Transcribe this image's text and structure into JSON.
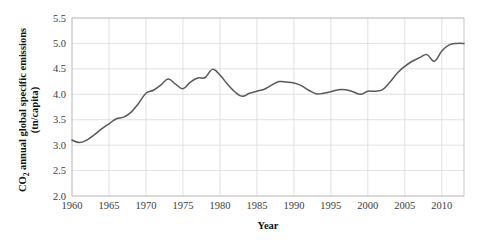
{
  "chart_data": {
    "type": "line",
    "title": "",
    "xlabel": "Year",
    "ylabel_main": "CO",
    "ylabel_sub": "2",
    "ylabel_rest": " annual global specific emissions",
    "ylabel_line2": "(tn/capita)",
    "ylabel_full": "CO2 annual global specific emissions (tn/capita)",
    "xlim": [
      1960,
      2013
    ],
    "ylim": [
      2.0,
      5.5
    ],
    "grid": true,
    "legend": "none",
    "y_ticks": [
      "2.0",
      "2.5",
      "3.0",
      "3.5",
      "4.0",
      "4.5",
      "5.0",
      "5.5"
    ],
    "y_tick_values": [
      2.0,
      2.5,
      3.0,
      3.5,
      4.0,
      4.5,
      5.0,
      5.5
    ],
    "x_ticks": [
      "1960",
      "1965",
      "1970",
      "1975",
      "1980",
      "1985",
      "1990",
      "1995",
      "2000",
      "2005",
      "2010"
    ],
    "x_tick_values": [
      1960,
      1965,
      1970,
      1975,
      1980,
      1985,
      1990,
      1995,
      2000,
      2005,
      2010
    ],
    "line_color": "#595959",
    "grid_color": "#d9d9d9",
    "background_color": "#ffffff",
    "series": [
      {
        "name": "CO2 emissions per capita",
        "x": [
          1960,
          1961,
          1962,
          1963,
          1964,
          1965,
          1966,
          1967,
          1968,
          1969,
          1970,
          1971,
          1972,
          1973,
          1974,
          1975,
          1976,
          1977,
          1978,
          1979,
          1980,
          1981,
          1982,
          1983,
          1984,
          1985,
          1986,
          1987,
          1988,
          1989,
          1990,
          1991,
          1992,
          1993,
          1994,
          1995,
          1996,
          1997,
          1998,
          1999,
          2000,
          2001,
          2002,
          2003,
          2004,
          2005,
          2006,
          2007,
          2008,
          2009,
          2010,
          2011,
          2012,
          2013
        ],
        "values": [
          3.1,
          3.05,
          3.1,
          3.2,
          3.32,
          3.42,
          3.52,
          3.55,
          3.65,
          3.82,
          4.02,
          4.08,
          4.18,
          4.3,
          4.2,
          4.11,
          4.24,
          4.32,
          4.33,
          4.49,
          4.38,
          4.2,
          4.05,
          3.96,
          4.02,
          4.06,
          4.1,
          4.18,
          4.25,
          4.24,
          4.22,
          4.17,
          4.08,
          4.01,
          4.02,
          4.05,
          4.09,
          4.09,
          4.05,
          4.0,
          4.06,
          4.06,
          4.09,
          4.24,
          4.42,
          4.55,
          4.65,
          4.72,
          4.78,
          4.65,
          4.85,
          4.97,
          5.0,
          5.0
        ]
      }
    ]
  }
}
